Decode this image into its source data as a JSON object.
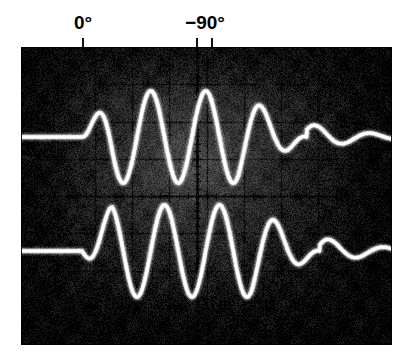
{
  "figure": {
    "kind": "oscilloscope-photograph",
    "background_color": "#ffffff"
  },
  "annotations": [
    {
      "name": "phase-label-0",
      "text": "0°",
      "x": 83,
      "tick_x": 83
    },
    {
      "name": "phase-label-m90",
      "text": "−90°",
      "x": 205,
      "tick_x": 197
    },
    {
      "name": "phase-tick-extra",
      "text": "",
      "x": 212,
      "tick_x": 212
    }
  ],
  "screen": {
    "x": 21,
    "y": 47,
    "width": 371,
    "height": 298,
    "background_color": "#090909",
    "phosphor_color": "#ffffff",
    "graticule_color": "#000000",
    "glow_color": "#6e6e6e",
    "divisions_x": 10,
    "divisions_y": 8,
    "center_axis_ticks": 40
  },
  "chart_data": {
    "type": "line",
    "xlabel": "Time (divisions)",
    "ylabel": "Amplitude",
    "grid": true,
    "legend": "none",
    "xlim": [
      0,
      371
    ],
    "ylim": [
      0,
      298
    ],
    "annotations": [
      {
        "label": "0°",
        "x": 83,
        "meaning": "reference phase marker for upper trace burst onset"
      },
      {
        "label": "−90°",
        "x": 197,
        "meaning": "lower trace lags reference by 90 degrees"
      }
    ],
    "series": [
      {
        "name": "upper-trace",
        "phase_deg": 0,
        "baseline_y": 137,
        "amplitude_px": 46,
        "period_px": 55,
        "burst_start_x": 82,
        "burst_end_x": 307,
        "cycles": 4,
        "peaks_x": [
          97,
          152,
          208,
          263
        ],
        "troughs_x": [
          124,
          180,
          235,
          290
        ],
        "color": "#ffffff"
      },
      {
        "name": "lower-trace",
        "phase_deg": -90,
        "baseline_y": 251,
        "amplitude_px": 46,
        "period_px": 55,
        "burst_start_x": 82,
        "burst_end_x": 320,
        "cycles": 4,
        "peaks_x": [
          111,
          166,
          221,
          277
        ],
        "troughs_x": [
          138,
          194,
          249,
          304
        ],
        "color": "#ffffff"
      }
    ]
  }
}
